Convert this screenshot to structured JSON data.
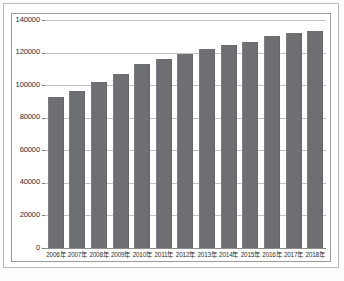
{
  "chart_data": {
    "type": "bar",
    "title": "",
    "xlabel": "",
    "ylabel": "",
    "ylim": [
      0,
      140000
    ],
    "yticks": [
      0,
      20000,
      40000,
      60000,
      80000,
      100000,
      120000,
      140000
    ],
    "ytick_labels": [
      "0",
      "20000",
      "40000",
      "60000",
      "80000",
      "100000",
      "120000",
      "140000"
    ],
    "grid": true,
    "legend": "none",
    "bar_color": "#6e6f72",
    "categories": [
      "2006年",
      "2007年",
      "2008年",
      "2009年",
      "2010年",
      "2011年",
      "2012年",
      "2013年",
      "2014年",
      "2015年",
      "2016年",
      "2017年",
      "2018年"
    ],
    "values": [
      92500,
      96500,
      102000,
      107000,
      113000,
      116000,
      119000,
      122000,
      124500,
      126500,
      130000,
      132000,
      133000
    ]
  },
  "caption": {
    "text": ""
  }
}
